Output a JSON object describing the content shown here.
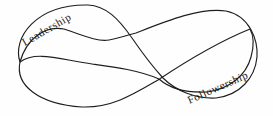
{
  "diagram": {
    "type": "mobius-infinity-ribbon",
    "background_color": "#fefefe",
    "stroke_color": "#1e1e1e",
    "labels": {
      "leadership": {
        "text": "Leadership",
        "angle_deg": -30,
        "position": "top-left band face"
      },
      "followership": {
        "text": "Followership",
        "angle_deg": -24,
        "position": "bottom-right band face"
      }
    }
  }
}
